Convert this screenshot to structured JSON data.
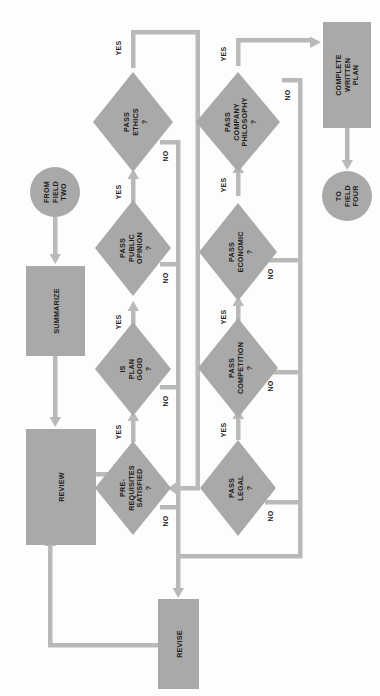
{
  "diagram": {
    "orientation": "rotated-90-ccw",
    "colors": {
      "shape_fill": "#a9a9a9",
      "connector": "#b9b9b9",
      "text": "#1d1d1d",
      "background": "#fdfdfd"
    },
    "nodes": {
      "from_field_two": {
        "shape": "circle",
        "lines": [
          "FROM",
          "FIELD",
          "TWO"
        ]
      },
      "summarize": {
        "shape": "process",
        "lines": [
          "SUMMARIZE"
        ]
      },
      "review": {
        "shape": "process",
        "lines": [
          "REVIEW"
        ]
      },
      "prerequisites": {
        "shape": "decision",
        "lines": [
          "PRE-",
          "REQUISITES",
          "SATISFIED"
        ],
        "mark": "?"
      },
      "is_plan_good": {
        "shape": "decision",
        "lines": [
          "IS",
          "PLAN",
          "GOOD"
        ],
        "mark": "?"
      },
      "pass_public_opinion": {
        "shape": "decision",
        "lines": [
          "PASS",
          "PUBLIC",
          "OPINION"
        ],
        "mark": "?"
      },
      "pass_ethics": {
        "shape": "decision",
        "lines": [
          "PASS",
          "ETHICS"
        ],
        "mark": "?"
      },
      "pass_legal": {
        "shape": "decision",
        "lines": [
          "PASS",
          "LEGAL"
        ],
        "mark": "?"
      },
      "pass_competition": {
        "shape": "decision",
        "lines": [
          "PASS",
          "COMPETITION"
        ],
        "mark": "?"
      },
      "pass_economic": {
        "shape": "decision",
        "lines": [
          "PASS",
          "ECONOMIC"
        ],
        "mark": "?"
      },
      "pass_company_philosophy": {
        "shape": "decision",
        "lines": [
          "PASS",
          "COMPANY",
          "PHILOSOPHY"
        ],
        "mark": "?"
      },
      "complete_written_plan": {
        "shape": "process",
        "lines": [
          "COMPLETE",
          "WRITTEN",
          "PLAN"
        ]
      },
      "to_field_four": {
        "shape": "circle",
        "lines": [
          "TO",
          "FIELD",
          "FOUR"
        ]
      },
      "revise": {
        "shape": "process",
        "lines": [
          "REVISE"
        ]
      }
    },
    "edge_labels": {
      "yes": "YES",
      "no": "NO"
    },
    "edges": [
      {
        "from": "from_field_two",
        "to": "summarize",
        "label": ""
      },
      {
        "from": "summarize",
        "to": "review",
        "label": ""
      },
      {
        "from": "review",
        "to": "prerequisites",
        "label": ""
      },
      {
        "from": "prerequisites",
        "to": "is_plan_good",
        "label": "YES"
      },
      {
        "from": "prerequisites",
        "to": "revise",
        "label": "NO"
      },
      {
        "from": "is_plan_good",
        "to": "pass_public_opinion",
        "label": "YES"
      },
      {
        "from": "is_plan_good",
        "to": "revise",
        "label": "NO"
      },
      {
        "from": "pass_public_opinion",
        "to": "pass_ethics",
        "label": "YES"
      },
      {
        "from": "pass_public_opinion",
        "to": "revise",
        "label": "NO"
      },
      {
        "from": "pass_ethics",
        "to": "pass_legal",
        "label": "YES"
      },
      {
        "from": "pass_ethics",
        "to": "revise",
        "label": "NO"
      },
      {
        "from": "pass_legal",
        "to": "pass_competition",
        "label": "YES"
      },
      {
        "from": "pass_legal",
        "to": "revise",
        "label": "NO"
      },
      {
        "from": "pass_competition",
        "to": "pass_economic",
        "label": "YES"
      },
      {
        "from": "pass_competition",
        "to": "revise",
        "label": "NO"
      },
      {
        "from": "pass_economic",
        "to": "pass_company_philosophy",
        "label": "YES"
      },
      {
        "from": "pass_economic",
        "to": "revise",
        "label": "NO"
      },
      {
        "from": "pass_company_philosophy",
        "to": "complete_written_plan",
        "label": "YES"
      },
      {
        "from": "pass_company_philosophy",
        "to": "revise",
        "label": "NO"
      },
      {
        "from": "complete_written_plan",
        "to": "to_field_four",
        "label": ""
      },
      {
        "from": "revise",
        "to": "review",
        "label": ""
      }
    ]
  }
}
